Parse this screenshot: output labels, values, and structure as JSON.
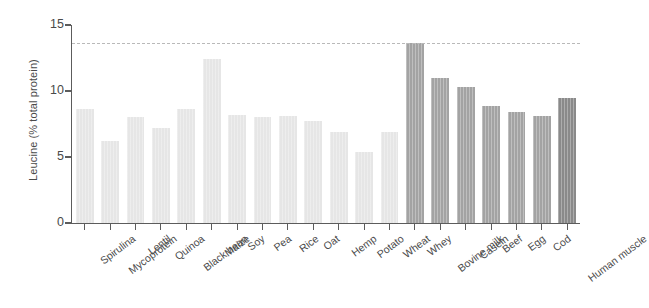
{
  "chart_data": {
    "type": "bar",
    "title": "",
    "xlabel": "",
    "ylabel": "Leucine (% total protein)",
    "ylim": [
      0,
      15
    ],
    "yticks": [
      0,
      5,
      10,
      15
    ],
    "ytick_labels": [
      "0",
      "5",
      "10",
      "15"
    ],
    "grid": false,
    "legend": "none",
    "categories": [
      "Spirulina",
      "Mycoprotein",
      "Lentil",
      "Quinoa",
      "Black bean",
      "Maize",
      "Soy",
      "Pea",
      "Rice",
      "Oat",
      "Hemp",
      "Potato",
      "Wheat",
      "Whey",
      "Bovine milk",
      "Casein",
      "Beef",
      "Egg",
      "Cod",
      "Human muscle"
    ],
    "values": [
      8.6,
      6.2,
      8.0,
      7.2,
      8.6,
      12.4,
      8.2,
      8.0,
      8.1,
      7.7,
      6.9,
      5.4,
      6.9,
      13.6,
      11.0,
      10.3,
      8.9,
      8.4,
      8.1,
      9.5
    ],
    "bar_groups": [
      "plant",
      "plant",
      "plant",
      "plant",
      "plant",
      "plant",
      "plant",
      "plant",
      "plant",
      "plant",
      "plant",
      "plant",
      "plant",
      "animal",
      "animal",
      "animal",
      "animal",
      "animal",
      "animal",
      "human"
    ],
    "annotations": [
      {
        "type": "reference-line",
        "orientation": "horizontal",
        "value": 13.6,
        "style": "dashed",
        "color": "#b9b9b9"
      }
    ],
    "colors": {
      "plant": "#e6e6e6",
      "animal": "#a3a3a3",
      "human": "#8a8a8a",
      "axis": "#5c5c5c",
      "text": "#4a4a4a",
      "reference_line": "#b9b9b9",
      "background": "#ffffff"
    }
  }
}
